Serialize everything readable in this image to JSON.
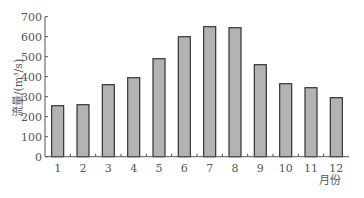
{
  "chart_data": {
    "type": "bar",
    "title": "",
    "xlabel": "月份",
    "ylabel": "流量/(m³/s)",
    "categories": [
      "1",
      "2",
      "3",
      "4",
      "5",
      "6",
      "7",
      "8",
      "9",
      "10",
      "11",
      "12"
    ],
    "values": [
      255,
      260,
      360,
      395,
      490,
      600,
      650,
      645,
      460,
      365,
      345,
      295
    ],
    "ylim": [
      0,
      700
    ],
    "yticks": [
      0,
      100,
      200,
      300,
      400,
      500,
      600,
      700
    ],
    "grid": false,
    "legend": null,
    "colors": {
      "bar_fill": "#b3b3b3",
      "bar_stroke": "#333333",
      "axis": "#555555"
    }
  }
}
